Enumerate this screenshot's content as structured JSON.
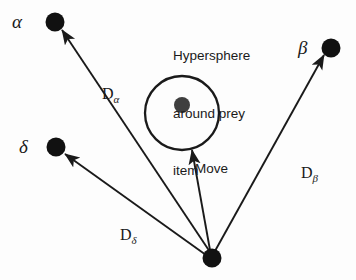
{
  "figure": {
    "background_color": "#fdfdfd",
    "stroke_color": "#1a1a1a",
    "node_color": "#111111",
    "prey_color": "#3f3f3f"
  },
  "caption": {
    "line1": "Hypersphere",
    "line2": "around prey",
    "line3": "item"
  },
  "nodes": {
    "alpha_label": "α",
    "beta_label": "β",
    "delta_label": "δ"
  },
  "distances": {
    "alpha": {
      "base": "D",
      "sub": "α"
    },
    "beta": {
      "base": "D",
      "sub": "β"
    },
    "delta": {
      "base": "D",
      "sub": "δ"
    }
  },
  "move": {
    "label": "Move"
  }
}
